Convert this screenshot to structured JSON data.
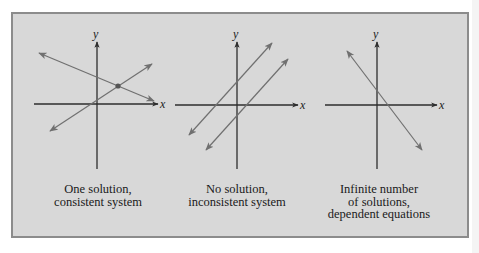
{
  "figure": {
    "background_color": "#d8d8d8",
    "border_color": "#8c8c8c",
    "line_color": "#707070",
    "axis_color": "#2e2e2e"
  },
  "panels": [
    {
      "id": "one-solution",
      "x_label": "x",
      "y_label": "y",
      "caption": [
        "One solution,",
        "consistent system"
      ],
      "lines": 2,
      "relationship": "intersecting"
    },
    {
      "id": "no-solution",
      "x_label": "x",
      "y_label": "y",
      "caption": [
        "No solution,",
        "inconsistent system"
      ],
      "lines": 2,
      "relationship": "parallel"
    },
    {
      "id": "infinite-solutions",
      "x_label": "x",
      "y_label": "y",
      "caption": [
        "Infinite number",
        "of solutions,",
        "dependent equations"
      ],
      "lines": 1,
      "relationship": "coincident"
    }
  ]
}
